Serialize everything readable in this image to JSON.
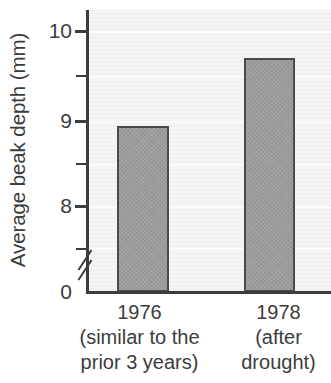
{
  "chart_data": {
    "type": "bar",
    "title": "",
    "subtitle": "",
    "xlabel": "",
    "ylabel": "Average beak depth (mm)",
    "categories": [
      "1976",
      "1978"
    ],
    "category_sublabels": [
      [
        "(similar to the",
        "prior 3 years)"
      ],
      [
        "(after",
        "drought)"
      ]
    ],
    "values": [
      8.95,
      9.7
    ],
    "value_unit": "mm",
    "ylim": [
      0,
      10.4
    ],
    "axis_break": {
      "present": true,
      "between": [
        0,
        7.5
      ],
      "symbol": "//"
    },
    "y_major_ticks": [
      10,
      9,
      8,
      0
    ],
    "y_major_tick_labels": [
      "10",
      "9",
      "8",
      "0"
    ],
    "y_minor_ticks": [
      9.5,
      8.5,
      7.6
    ],
    "grid": {
      "horizontal": true,
      "vertical": false
    },
    "legend": {
      "present": false,
      "position": "none"
    },
    "colors": {
      "bar_fill": "#9c9c9c",
      "bar_edge": "#4a4a4a",
      "plot_background": "#f0f0f0",
      "axis": "#3d3d3d",
      "text": "#3c3c3c",
      "gridline": "#fbfbfb"
    }
  },
  "axis": {
    "y_title": "Average beak depth (mm)",
    "ticks": [
      {
        "label": "10",
        "value": 10
      },
      {
        "label": "9",
        "value": 9
      },
      {
        "label": "8",
        "value": 8
      },
      {
        "label": "0",
        "value": 0
      }
    ]
  },
  "bars": [
    {
      "year": "1976",
      "sub_line1": "(similar to the",
      "sub_line2": "prior 3 years)",
      "value": 8.95
    },
    {
      "year": "1978",
      "sub_line1": "(after",
      "sub_line2": "drought)",
      "value": 9.7
    }
  ]
}
